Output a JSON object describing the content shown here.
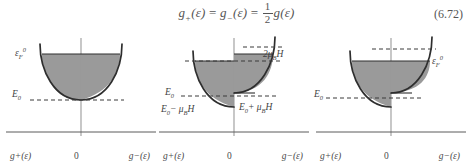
{
  "equation": {
    "text": "g+(ε) = g−(ε) = ½ g(ε)",
    "lhs_1": "g",
    "lhs_1_sub": "+",
    "lhs_1_arg": "(ε)",
    "eq_1": "=",
    "lhs_2": "g",
    "lhs_2_sub": "−",
    "lhs_2_arg": "(ε)",
    "eq_2": "=",
    "frac_num": "1",
    "frac_den": "2",
    "rhs": "g",
    "rhs_arg": "(ε)",
    "number": "(6.72)"
  },
  "panels": [
    {
      "id": "panel-1",
      "name": "zero-field-band",
      "axis": {
        "left": "g+(ε)",
        "origin": "0",
        "right": "g−(ε)"
      },
      "labels": [
        {
          "name": "fermi-level-label",
          "text": "ε",
          "sub": "F",
          "sup": "0",
          "x": 13,
          "y": 17
        },
        {
          "name": "band-bottom-label",
          "text": "E",
          "sub": "0",
          "sup": "",
          "x": 10,
          "y": 60
        }
      ],
      "fermi_level": 22,
      "band_bottom": 68,
      "fill_left": true,
      "fill_right": true,
      "fill_level_left": 22,
      "fill_level_right": 22,
      "shift_left": 0,
      "shift_right": 0
    },
    {
      "id": "panel-2",
      "name": "split-bands-unequilibrated",
      "axis": {
        "left": "g+(ε)",
        "origin": "0",
        "right": "g−(ε)"
      },
      "labels": [
        {
          "name": "zeeman-splitting-label",
          "text": "2μ",
          "sub": "B",
          "sup": "",
          "tail": "H",
          "x": 108,
          "y": 27
        },
        {
          "name": "band-bottom-label",
          "text": "E",
          "sub": "0",
          "sup": "",
          "x": 10,
          "y": 60
        },
        {
          "name": "band-bottom-minus-label",
          "text": "E",
          "sub": "0",
          "sup": "",
          "tail": "− μ",
          "tail_sub": "B",
          "tail2": "H",
          "x": 8,
          "y": 76
        },
        {
          "name": "band-bottom-plus-label",
          "text": "E",
          "sub": "0",
          "sup": "",
          "tail": "+ μ",
          "tail_sub": "B",
          "tail2": "H",
          "x": 78,
          "y": 74
        }
      ],
      "fermi_level": 22,
      "band_bottom": 68,
      "fill_left": true,
      "fill_right": true,
      "fill_level_left": 29,
      "fill_level_right": 22,
      "shift_left": 7,
      "shift_right": -7
    },
    {
      "id": "panel-3",
      "name": "split-bands-equilibrated",
      "axis": {
        "left": "g+(ε)",
        "origin": "0",
        "right": "g−(ε)"
      },
      "labels": [
        {
          "name": "fermi-level-label",
          "text": "ε",
          "sub": "F",
          "sup": "0",
          "x": 118,
          "y": 26
        },
        {
          "name": "band-bottom-label",
          "text": "E",
          "sub": "0",
          "sup": "",
          "x": 4,
          "y": 60
        }
      ],
      "fermi_level": 22,
      "band_bottom": 68,
      "fill_left": true,
      "fill_right": true,
      "fill_level_left": 29,
      "fill_level_right": 29,
      "shift_left": 7,
      "shift_right": -7
    }
  ],
  "colors": {
    "fill": "#9a9a9a",
    "curve": "#2e2e2e",
    "axis": "#8c8c8c",
    "dashed": "#3a3a3a",
    "text": "#4a4a4a"
  }
}
